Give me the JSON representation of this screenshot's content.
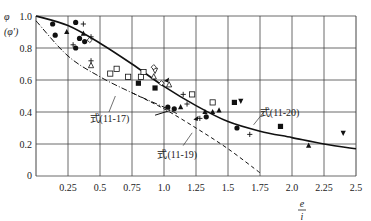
{
  "chart_data": {
    "type": "scatter",
    "title": "",
    "xlabel": "e/i",
    "xlabel_num": "e",
    "xlabel_den": "i",
    "ylabel": "φ",
    "ylabel_alt": "(φ')",
    "xlim": [
      0,
      2.5
    ],
    "ylim": [
      0,
      1.0
    ],
    "grid": true,
    "x_ticks": [
      "0.25",
      "0.5",
      "0.75",
      "1.0",
      "1.25",
      "1.5",
      "1.75",
      "2.0",
      "2.25",
      "2.5"
    ],
    "y_ticks": [
      "0",
      "0.2",
      "0.4",
      "0.6",
      "0.8",
      "1.0"
    ],
    "curves": [
      {
        "name": "式(11-20)",
        "style": "solid",
        "x": [
          0,
          0.25,
          0.5,
          0.75,
          1.0,
          1.25,
          1.5,
          1.75,
          2.0,
          2.25,
          2.5
        ],
        "y": [
          1.0,
          0.94,
          0.83,
          0.7,
          0.56,
          0.44,
          0.34,
          0.28,
          0.24,
          0.2,
          0.17
        ]
      },
      {
        "name": "式(11-17)",
        "style": "dashdot",
        "x": [
          0,
          0.25,
          0.5,
          0.75,
          1.0,
          1.1
        ],
        "y": [
          0.97,
          0.75,
          0.62,
          0.52,
          0.43,
          0.39
        ]
      },
      {
        "name": "式(11-19)",
        "style": "dashed",
        "x": [
          0.75,
          1.0,
          1.25,
          1.5,
          1.75
        ],
        "y": [
          0.52,
          0.42,
          0.3,
          0.17,
          0.02
        ]
      }
    ],
    "annotations": [
      {
        "text": "式(11-17)",
        "x": 0.45,
        "y": 0.36
      },
      {
        "text": "式(11-19)",
        "x": 0.98,
        "y": 0.14
      },
      {
        "text": "式(11-20)",
        "x": 1.78,
        "y": 0.4
      }
    ],
    "points": [
      {
        "marker": "circle",
        "x": 0.13,
        "y": 0.95
      },
      {
        "marker": "circle",
        "x": 0.15,
        "y": 0.88
      },
      {
        "marker": "circle",
        "x": 0.31,
        "y": 0.96
      },
      {
        "marker": "circle",
        "x": 0.34,
        "y": 0.86
      },
      {
        "marker": "circle",
        "x": 0.38,
        "y": 0.84
      },
      {
        "marker": "circle",
        "x": 0.31,
        "y": 0.8
      },
      {
        "marker": "circle",
        "x": 1.03,
        "y": 0.43
      },
      {
        "marker": "circle",
        "x": 1.08,
        "y": 0.42
      },
      {
        "marker": "circle",
        "x": 1.33,
        "y": 0.37
      },
      {
        "marker": "circle",
        "x": 1.57,
        "y": 0.3
      },
      {
        "marker": "triangle",
        "x": 0.24,
        "y": 0.9
      },
      {
        "marker": "triangle",
        "x": 0.37,
        "y": 0.89
      },
      {
        "marker": "triangle",
        "x": 1.13,
        "y": 0.43
      },
      {
        "marker": "triangle",
        "x": 1.32,
        "y": 0.4
      },
      {
        "marker": "triangle",
        "x": 1.38,
        "y": 0.4
      },
      {
        "marker": "triangle",
        "x": 1.43,
        "y": 0.41
      },
      {
        "marker": "triangle",
        "x": 2.13,
        "y": 0.19
      },
      {
        "marker": "triangle-open",
        "x": 0.43,
        "y": 0.69
      },
      {
        "marker": "triangle-open",
        "x": 0.92,
        "y": 0.62
      },
      {
        "marker": "triangle-open",
        "x": 1.04,
        "y": 0.57
      },
      {
        "marker": "triangle-down-filled",
        "x": 1.6,
        "y": 0.47
      },
      {
        "marker": "triangle-down-filled",
        "x": 2.4,
        "y": 0.27
      },
      {
        "marker": "triangle-open-down",
        "x": 0.93,
        "y": 0.66
      },
      {
        "marker": "square",
        "x": 0.8,
        "y": 0.58
      },
      {
        "marker": "square",
        "x": 0.93,
        "y": 0.55
      },
      {
        "marker": "square",
        "x": 1.55,
        "y": 0.46
      },
      {
        "marker": "square",
        "x": 1.91,
        "y": 0.31
      },
      {
        "marker": "square-open",
        "x": 0.58,
        "y": 0.64
      },
      {
        "marker": "square-open",
        "x": 0.63,
        "y": 0.67
      },
      {
        "marker": "square-open",
        "x": 0.72,
        "y": 0.62
      },
      {
        "marker": "square-open",
        "x": 0.82,
        "y": 0.62
      },
      {
        "marker": "square-open",
        "x": 1.22,
        "y": 0.51
      },
      {
        "marker": "square-open",
        "x": 1.38,
        "y": 0.46
      },
      {
        "marker": "square-open",
        "x": 0.84,
        "y": 0.65
      },
      {
        "marker": "diamond-open",
        "x": 0.42,
        "y": 0.85
      },
      {
        "marker": "diamond-open",
        "x": 0.92,
        "y": 0.68
      },
      {
        "marker": "diamond-open",
        "x": 0.98,
        "y": 0.58
      },
      {
        "marker": "plus",
        "x": 0.37,
        "y": 0.95
      },
      {
        "marker": "plus",
        "x": 0.43,
        "y": 0.87
      },
      {
        "marker": "plus",
        "x": 0.29,
        "y": 0.82
      },
      {
        "marker": "plus",
        "x": 0.43,
        "y": 0.72
      },
      {
        "marker": "plus",
        "x": 1.15,
        "y": 0.51
      },
      {
        "marker": "plus",
        "x": 1.18,
        "y": 0.45
      },
      {
        "marker": "plus",
        "x": 1.28,
        "y": 0.36
      },
      {
        "marker": "plus",
        "x": 1.67,
        "y": 0.26
      },
      {
        "marker": "filled-wedge",
        "x": 1.02,
        "y": 0.6
      },
      {
        "marker": "filled-wedge",
        "x": 1.25,
        "y": 0.36
      }
    ]
  }
}
